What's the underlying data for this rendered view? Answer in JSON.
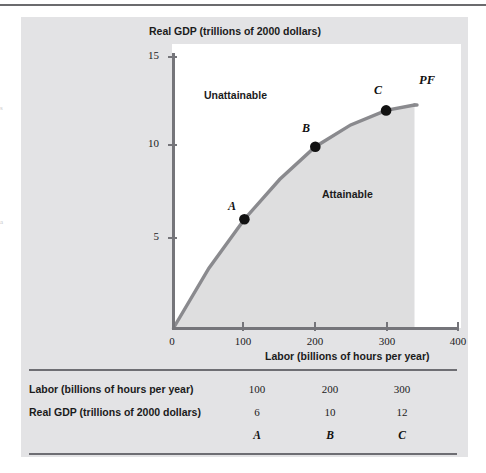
{
  "chart_data": {
    "type": "line",
    "title": "Real GDP (trillions of 2000 dollars)",
    "xlabel": "Labor (billions of hours per year)",
    "ylabel": "Real GDP (trillions of 2000 dollars)",
    "xlim": [
      0,
      400
    ],
    "ylim": [
      0,
      15
    ],
    "xticks": [
      "0",
      "100",
      "200",
      "300",
      "400"
    ],
    "xtick_values": [
      0,
      100,
      200,
      300,
      400
    ],
    "yticks": [
      "15",
      "10",
      "5"
    ],
    "ytick_values": [
      15,
      10,
      5
    ],
    "grid": false,
    "legend": "none",
    "curve_label": "PF",
    "series": [
      {
        "name": "PF",
        "x": [
          0,
          50,
          100,
          150,
          200,
          250,
          300,
          340
        ],
        "y": [
          0,
          3.3,
          6.0,
          8.2,
          10.0,
          11.2,
          12.0,
          12.3
        ]
      }
    ],
    "points": [
      {
        "label": "A",
        "x": 100,
        "y": 6
      },
      {
        "label": "B",
        "x": 200,
        "y": 10
      },
      {
        "label": "C",
        "x": 300,
        "y": 12
      }
    ],
    "annotations": [
      {
        "text": "Unattainable",
        "x": 110,
        "y": 13.2
      },
      {
        "text": "Attainable",
        "x": 250,
        "y": 7.4
      }
    ]
  },
  "table": {
    "rows": [
      {
        "header": "Labor (billions of hours per year)",
        "values": [
          "100",
          "200",
          "300"
        ]
      },
      {
        "header": "Real GDP (trillions of 2000 dollars)",
        "values": [
          "6",
          "10",
          "12"
        ]
      }
    ],
    "point_row": [
      "A",
      "B",
      "C"
    ]
  },
  "margin_fragments": [
    "s",
    "a"
  ],
  "colors": {
    "panel_background": "#e3e3e5",
    "plot_background": "#ffffff",
    "curve": "#8a8a8e",
    "shaded_region": "#dededf",
    "axis": "#75757a",
    "rule": "#6e6e73",
    "point": "#121212",
    "text": "#1b1b1b"
  }
}
